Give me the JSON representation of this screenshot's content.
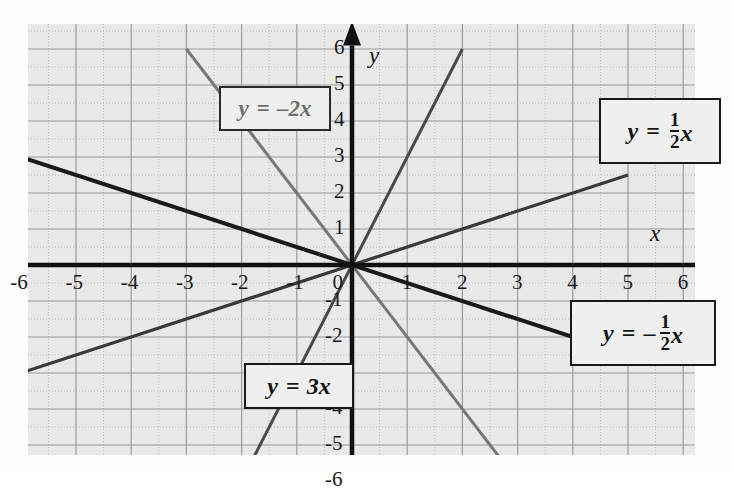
{
  "figure": {
    "background_color": "#e9e9e9",
    "page_color": "#ffffff",
    "axis_color": "#111111",
    "grid_major_color": "#9a9aa2",
    "grid_minor_color": "#b8b8c0"
  },
  "axes": {
    "x_axis_label": "x",
    "y_axis_label": "y",
    "x_ticks": [
      "-6",
      "-5",
      "-4",
      "-3",
      "-2",
      "-1",
      "0",
      "1",
      "2",
      "3",
      "4",
      "5",
      "6"
    ],
    "y_ticks": [
      "6",
      "5",
      "4",
      "3",
      "2",
      "1",
      "-1",
      "-2",
      "-3",
      "-4",
      "-5",
      "-6"
    ],
    "origin_label": "0",
    "xlim": [
      -6.4,
      6.4
    ],
    "ylim": [
      -6.6,
      6.6
    ]
  },
  "chart_data": {
    "type": "line",
    "title": "",
    "xlabel": "x",
    "ylabel": "y",
    "xlim": [
      -6.4,
      6.4
    ],
    "ylim": [
      -6.6,
      6.6
    ],
    "grid": true,
    "grid_major_step": 1,
    "grid_minor_step": 0.5,
    "legend": "inline-callout-boxes",
    "series": [
      {
        "name": "y = -2x",
        "slope": -2,
        "intercept": 0,
        "color": "#787878",
        "linewidth": 3,
        "x": [
          -3,
          3
        ],
        "y": [
          6,
          -6
        ]
      },
      {
        "name": "y = 3x",
        "slope": 3,
        "intercept": 0,
        "color": "#4a4a4a",
        "linewidth": 3,
        "x": [
          -2,
          2
        ],
        "y": [
          -6,
          6
        ]
      },
      {
        "name": "y = 1/2 x",
        "slope": 0.5,
        "intercept": 0,
        "color": "#3a3a3a",
        "linewidth": 3.2,
        "x": [
          -6,
          5
        ],
        "y": [
          -3,
          2.5
        ]
      },
      {
        "name": "y = -1/2 x",
        "slope": -0.5,
        "intercept": 0,
        "color": "#1a1a1a",
        "linewidth": 4,
        "x": [
          -6,
          5.3
        ],
        "y": [
          3,
          -2.65
        ]
      }
    ]
  },
  "callouts": {
    "minus2x": {
      "lhs": "y",
      "eq": "=",
      "rhs": "–2x"
    },
    "three_x": {
      "lhs": "y",
      "eq": "=",
      "rhs": "3x"
    },
    "half_x": {
      "lhs": "y",
      "eq": "=",
      "num": "1",
      "den": "2",
      "var": "x"
    },
    "neg_half_x": {
      "lhs": "y",
      "eq": "=",
      "sign": "–",
      "num": "1",
      "den": "2",
      "var": "x"
    }
  }
}
